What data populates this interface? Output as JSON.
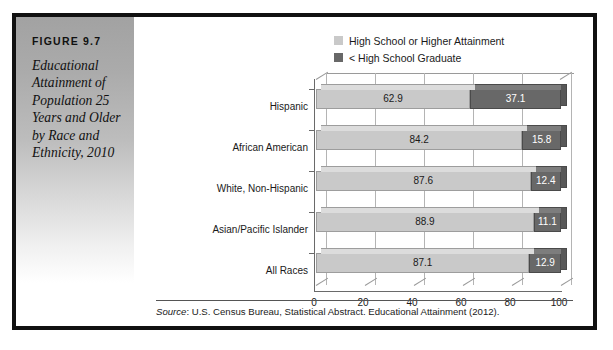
{
  "figure": {
    "number": "FIGURE 9.7",
    "title": "Educational Attainment of Population 25 Years and Older by Race and Ethnicity, 2010",
    "source_keyword": "Source",
    "source_text": ": U.S. Census Bureau, Statistical Abstract. Educational Attainment (2012)."
  },
  "colors": {
    "light_series": "#c9c9c9",
    "dark_series": "#686868",
    "frame": "#111111",
    "grid": "#b4b4b4",
    "axis": "#6a6a6a"
  },
  "chart_data": {
    "type": "bar",
    "orientation": "horizontal",
    "stacked": true,
    "title": "Educational Attainment of Population 25 Years and Older by Race and Ethnicity, 2010",
    "xlabel": "",
    "ylabel": "",
    "xlim": [
      0,
      100
    ],
    "xticks": [
      0,
      20,
      40,
      60,
      80,
      100
    ],
    "xtick_labels": [
      "0",
      "20",
      "40",
      "60",
      "80",
      "100"
    ],
    "grid": true,
    "legend_position": "top",
    "categories": [
      "Hispanic",
      "African American",
      "White, Non-Hispanic",
      "Asian/Pacific Islander",
      "All Races"
    ],
    "series": [
      {
        "name": "High School or Higher Attainment",
        "color": "#c9c9c9",
        "values": [
          62.9,
          84.2,
          87.6,
          88.9,
          87.1
        ],
        "labels": [
          "62.9",
          "84.2",
          "87.6",
          "88.9",
          "87.1"
        ]
      },
      {
        "name": "< High School Graduate",
        "color": "#686868",
        "values": [
          37.1,
          15.8,
          12.4,
          11.1,
          12.9
        ],
        "labels": [
          "37.1",
          "15.8",
          "12.4",
          "11.1",
          "12.9"
        ]
      }
    ]
  }
}
